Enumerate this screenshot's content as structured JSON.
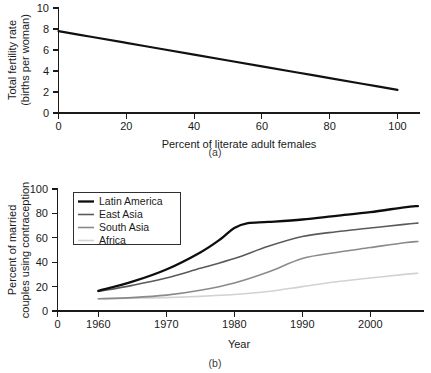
{
  "figure": {
    "panel_a_caption": "(a)",
    "panel_b_caption": "(b)"
  },
  "chart_data": [
    {
      "id": "panel-a",
      "type": "line",
      "title": "",
      "xlabel": "Percent of literate adult females",
      "ylabel": "Total fertility rate\n(births per woman)",
      "ylabel_line1": "Total fertility rate",
      "ylabel_line2": "(births per woman)",
      "xlim": [
        0,
        108
      ],
      "ylim": [
        0,
        10.6
      ],
      "xticks": [
        0,
        20,
        40,
        60,
        80,
        100
      ],
      "xticklabels": [
        "0",
        "20",
        "40",
        "60",
        "80",
        "100"
      ],
      "yticks": [
        0,
        2,
        4,
        6,
        8,
        10
      ],
      "yticklabels": [
        "0",
        "2",
        "4",
        "6",
        "8",
        "10"
      ],
      "grid": false,
      "legend": "none",
      "series": [
        {
          "name": "Total fertility rate",
          "color": "#111111",
          "width": 2.2,
          "x": [
            0,
            10,
            20,
            30,
            40,
            50,
            60,
            70,
            80,
            90,
            100
          ],
          "values": [
            7.8,
            7.24,
            6.68,
            6.12,
            5.56,
            5.0,
            4.44,
            3.88,
            3.32,
            2.76,
            2.2
          ]
        }
      ]
    },
    {
      "id": "panel-b",
      "type": "line",
      "title": "",
      "xlabel": "Year",
      "ylabel": "Percent of married\ncouples using contraception",
      "ylabel_line1": "Percent of married",
      "ylabel_line2": "couples using contraception",
      "xlim": [
        1954,
        2008
      ],
      "ylim": [
        0,
        108
      ],
      "xticks": [
        1954,
        1960,
        1970,
        1980,
        1990,
        2000
      ],
      "xticklabels": [
        "0",
        "1960",
        "1970",
        "1980",
        "1990",
        "2000"
      ],
      "yticks": [
        0,
        20,
        40,
        60,
        80,
        100
      ],
      "yticklabels": [
        "0",
        "20",
        "40",
        "60",
        "80",
        "100"
      ],
      "grid": false,
      "legend": "upper left",
      "series": [
        {
          "name": "Latin America",
          "color": "#0d0d0d",
          "width": 2.3,
          "x": [
            1960,
            1965,
            1970,
            1975,
            1978,
            1980,
            1982,
            1985,
            1990,
            1995,
            2000,
            2005,
            2007
          ],
          "values": [
            16.5,
            24,
            34,
            48,
            59,
            68,
            72,
            73,
            75,
            78,
            81,
            85,
            86
          ]
        },
        {
          "name": "East Asia",
          "color": "#5a5a5a",
          "width": 1.6,
          "x": [
            1960,
            1965,
            1970,
            1975,
            1980,
            1985,
            1990,
            1995,
            2000,
            2005,
            2007
          ],
          "values": [
            16,
            21,
            27,
            35,
            43,
            53,
            61,
            65,
            68,
            71,
            72
          ]
        },
        {
          "name": "South Asia",
          "color": "#8a8a8a",
          "width": 1.6,
          "x": [
            1960,
            1965,
            1970,
            1975,
            1980,
            1985,
            1990,
            1995,
            2000,
            2005,
            2007
          ],
          "values": [
            10,
            11,
            13,
            17,
            23,
            32,
            43,
            48,
            52,
            56,
            57
          ]
        },
        {
          "name": "Africa",
          "color": "#d2d2d2",
          "width": 1.6,
          "x": [
            1960,
            1965,
            1970,
            1975,
            1980,
            1985,
            1990,
            1995,
            2000,
            2005,
            2007
          ],
          "values": [
            10,
            10.5,
            11,
            12,
            13.5,
            16,
            20,
            24,
            27,
            30,
            31
          ]
        }
      ]
    }
  ]
}
